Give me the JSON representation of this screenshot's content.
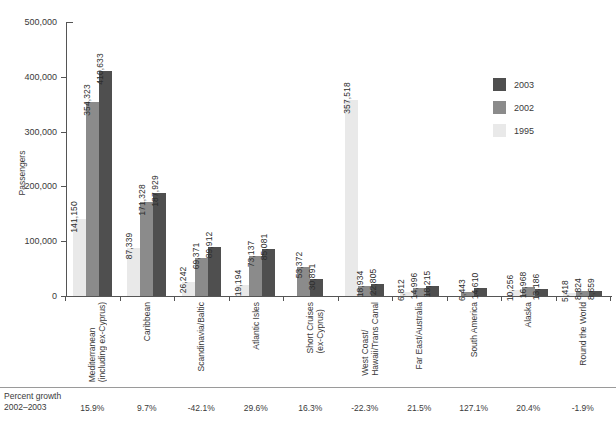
{
  "chart_data": {
    "type": "bar",
    "title": "",
    "xlabel": "",
    "ylabel": "Passengers",
    "ylim": [
      0,
      500000
    ],
    "yticks": [
      "0",
      "100,000",
      "200,000",
      "300,000",
      "400,000",
      "500,000"
    ],
    "ytick_values": [
      0,
      100000,
      200000,
      300000,
      400000,
      500000
    ],
    "grid": false,
    "legend_position": "right",
    "categories": [
      "Mediterranean\n(including ex-Cyprus)",
      "Caribbean",
      "Scandinavia/Baltic",
      "Atlantic Isles",
      "Short Cruises\n(ex-Cyprus)",
      "West Coast/\nHawaii/Trans Canal",
      "Far East/Australia",
      "South America",
      "Alaska",
      "Round the World"
    ],
    "series": [
      {
        "name": "1995",
        "color": "#e9e9e9",
        "values": [
          141150,
          87339,
          26242,
          19194,
          null,
          357518,
          6812,
          null,
          10256,
          5418
        ],
        "labels": [
          "141,150",
          "87,339",
          "26,242",
          "19,194",
          "",
          "357,518",
          "6,812",
          "",
          "10,256",
          "5,418"
        ]
      },
      {
        "name": "2002",
        "color": "#8b8b8b",
        "values": [
          354323,
          171328,
          69371,
          73137,
          53372,
          18934,
          14996,
          6443,
          16968,
          8824
        ],
        "labels": [
          "354,323",
          "171,328",
          "69,371",
          "73,137",
          "53,372",
          "18,934",
          "14,996",
          "6,443",
          "16,968",
          "8,824"
        ]
      },
      {
        "name": "2003",
        "color": "#4f4f4f",
        "values": [
          410633,
          187929,
          89912,
          85081,
          30891,
          22805,
          18215,
          14610,
          13186,
          8659
        ],
        "labels": [
          "410,633",
          "187,929",
          "89,912",
          "85,081",
          "30,891",
          "22,805",
          "18,215",
          "14,610",
          "13,186",
          "8,659"
        ]
      }
    ],
    "footer": {
      "title": "Percent growth\n2002–2003",
      "values": [
        "15.9%",
        "9.7%",
        "-42.1%",
        "29.6%",
        "16.3%",
        "-22.3%",
        "21.5%",
        "127.1%",
        "20.4%",
        "-1.9%"
      ]
    },
    "source_note": ""
  },
  "legend": {
    "items": [
      {
        "label": "2003",
        "color": "#4f4f4f"
      },
      {
        "label": "2002",
        "color": "#8b8b8b"
      },
      {
        "label": "1995",
        "color": "#e9e9e9"
      }
    ]
  },
  "colors": {
    "axis": "#555555",
    "text": "#3a3a3a",
    "c1995": "#e9e9e9",
    "c2002": "#8b8b8b",
    "c2003": "#4f4f4f"
  }
}
